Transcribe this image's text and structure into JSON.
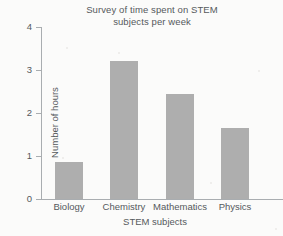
{
  "chart_data": {
    "type": "bar",
    "title": "Survey of time spent on STEM subjects per week",
    "title_lines": [
      "Survey of time spent on STEM",
      "subjects per week"
    ],
    "xlabel": "STEM subjects",
    "ylabel": "Number of hours",
    "categories": [
      "Biology",
      "Chemistry",
      "Mathematics",
      "Physics"
    ],
    "values": [
      0.85,
      3.2,
      2.45,
      1.65
    ],
    "ylim": [
      0,
      4
    ],
    "yticks": [
      0,
      1,
      2,
      3,
      4
    ],
    "ytick_labels": [
      "0",
      "1",
      "2",
      "3",
      "4"
    ],
    "grid": false,
    "legend": false,
    "bar_color": "#aeaeae",
    "axis_color": "#a9adb0",
    "text_color": "#55595c",
    "background_color": "#fbfbfa"
  }
}
